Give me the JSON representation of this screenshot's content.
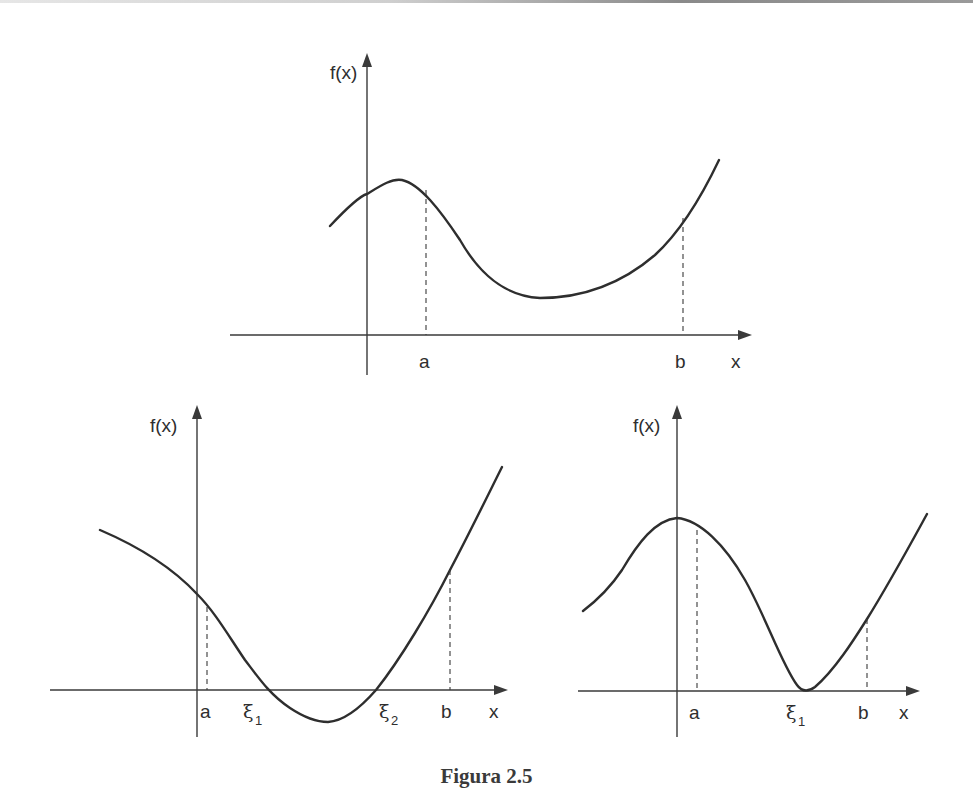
{
  "caption": "Figura 2.5",
  "colors": {
    "ink": "#2e2e2e",
    "axis": "#3a3a3a",
    "background": "#ffffff"
  },
  "plots": [
    {
      "id": "top",
      "y_axis_label": "f(x)",
      "x_axis_label": "x",
      "ticks": [
        {
          "label": "a"
        },
        {
          "label": "b"
        }
      ],
      "description": "f has no root in [a,b]; curve rises to a local max near a, dips to a positive minimum, rises past b"
    },
    {
      "id": "bottom-left",
      "y_axis_label": "f(x)",
      "x_axis_label": "x",
      "ticks": [
        {
          "label": "a"
        },
        {
          "label": "ξ",
          "subscript": "1"
        },
        {
          "label": "ξ",
          "subscript": "2"
        },
        {
          "label": "b"
        }
      ],
      "description": "f crosses the x-axis twice in [a,b] at ξ1 and ξ2"
    },
    {
      "id": "bottom-right",
      "y_axis_label": "f(x)",
      "x_axis_label": "x",
      "ticks": [
        {
          "label": "a"
        },
        {
          "label": "ξ",
          "subscript": "1"
        },
        {
          "label": "b"
        }
      ],
      "description": "f touches the x-axis at a double root ξ1 in [a,b]"
    }
  ]
}
